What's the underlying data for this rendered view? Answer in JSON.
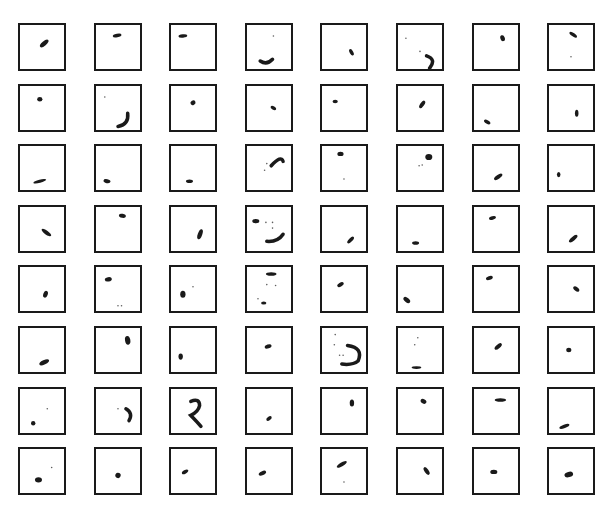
{
  "figure": {
    "rows": 8,
    "cols": 8,
    "layout": {
      "x0": 18,
      "y0": 23,
      "dx": 75.6,
      "dy": 60.6,
      "box": 46
    },
    "colors": {
      "ink": "#1a1a1a",
      "border": "#1a1a1a",
      "background": "#ffffff"
    },
    "cells": [
      [
        {
          "shapes": [
            {
              "t": "blob",
              "x": 0.55,
              "y": 0.42,
              "rx": 0.12,
              "ry": 0.05,
              "rot": -40
            }
          ]
        },
        {
          "shapes": [
            {
              "t": "blob",
              "x": 0.48,
              "y": 0.24,
              "rx": 0.1,
              "ry": 0.04,
              "rot": -10
            }
          ]
        },
        {
          "shapes": [
            {
              "t": "blob",
              "x": 0.27,
              "y": 0.25,
              "rx": 0.1,
              "ry": 0.04,
              "rot": -5
            }
          ]
        },
        {
          "shapes": [
            {
              "t": "arc",
              "d": "M0.3,0.82 Q0.45,0.92 0.58,0.78"
            },
            {
              "t": "dot",
              "x": 0.6,
              "y": 0.25
            }
          ]
        },
        {
          "shapes": [
            {
              "t": "blob",
              "x": 0.67,
              "y": 0.62,
              "rx": 0.08,
              "ry": 0.04,
              "rot": 60
            }
          ]
        },
        {
          "shapes": [
            {
              "t": "dot",
              "x": 0.18,
              "y": 0.3
            },
            {
              "t": "dot",
              "x": 0.5,
              "y": 0.6
            },
            {
              "t": "arc",
              "d": "M0.65,0.7 Q0.88,0.78 0.72,0.98"
            }
          ]
        },
        {
          "shapes": [
            {
              "t": "blob",
              "x": 0.65,
              "y": 0.3,
              "rx": 0.07,
              "ry": 0.05,
              "rot": 70
            }
          ]
        },
        {
          "shapes": [
            {
              "t": "blob",
              "x": 0.55,
              "y": 0.22,
              "rx": 0.1,
              "ry": 0.04,
              "rot": 35
            },
            {
              "t": "dot",
              "x": 0.5,
              "y": 0.72
            }
          ]
        }
      ],
      [
        {
          "shapes": [
            {
              "t": "blob",
              "x": 0.45,
              "y": 0.3,
              "rx": 0.06,
              "ry": 0.05,
              "rot": 0
            }
          ]
        },
        {
          "shapes": [
            {
              "t": "dot",
              "x": 0.2,
              "y": 0.25
            },
            {
              "t": "arc",
              "d": "M0.72,0.62 Q0.75,0.88 0.5,0.92"
            }
          ]
        },
        {
          "shapes": [
            {
              "t": "blob",
              "x": 0.5,
              "y": 0.38,
              "rx": 0.06,
              "ry": 0.05,
              "rot": -30
            }
          ]
        },
        {
          "shapes": [
            {
              "t": "blob",
              "x": 0.6,
              "y": 0.5,
              "rx": 0.07,
              "ry": 0.04,
              "rot": 30
            }
          ]
        },
        {
          "shapes": [
            {
              "t": "blob",
              "x": 0.3,
              "y": 0.35,
              "rx": 0.06,
              "ry": 0.04,
              "rot": 0
            }
          ]
        },
        {
          "shapes": [
            {
              "t": "blob",
              "x": 0.55,
              "y": 0.42,
              "rx": 0.1,
              "ry": 0.045,
              "rot": -55
            }
          ]
        },
        {
          "shapes": [
            {
              "t": "blob",
              "x": 0.3,
              "y": 0.82,
              "rx": 0.08,
              "ry": 0.04,
              "rot": 30
            }
          ]
        },
        {
          "shapes": [
            {
              "t": "blob",
              "x": 0.63,
              "y": 0.62,
              "rx": 0.04,
              "ry": 0.08,
              "rot": 0
            }
          ]
        }
      ],
      [
        {
          "shapes": [
            {
              "t": "blob",
              "x": 0.45,
              "y": 0.8,
              "rx": 0.15,
              "ry": 0.035,
              "rot": -15
            }
          ]
        },
        {
          "shapes": [
            {
              "t": "blob",
              "x": 0.25,
              "y": 0.8,
              "rx": 0.08,
              "ry": 0.045,
              "rot": 10
            }
          ]
        },
        {
          "shapes": [
            {
              "t": "blob",
              "x": 0.42,
              "y": 0.8,
              "rx": 0.08,
              "ry": 0.04,
              "rot": 0
            }
          ]
        },
        {
          "shapes": [
            {
              "t": "arc",
              "d": "M0.55,0.45 Q0.78,0.2 0.82,0.35"
            },
            {
              "t": "dot",
              "x": 0.45,
              "y": 0.4
            },
            {
              "t": "dot",
              "x": 0.4,
              "y": 0.55
            }
          ]
        },
        {
          "shapes": [
            {
              "t": "blob",
              "x": 0.42,
              "y": 0.18,
              "rx": 0.07,
              "ry": 0.05,
              "rot": 0
            },
            {
              "t": "dot",
              "x": 0.5,
              "y": 0.75
            }
          ]
        },
        {
          "shapes": [
            {
              "t": "blob",
              "x": 0.7,
              "y": 0.25,
              "rx": 0.08,
              "ry": 0.07,
              "rot": 0
            },
            {
              "t": "dot",
              "x": 0.48,
              "y": 0.45
            },
            {
              "t": "dot",
              "x": 0.55,
              "y": 0.43
            }
          ]
        },
        {
          "shapes": [
            {
              "t": "blob",
              "x": 0.55,
              "y": 0.7,
              "rx": 0.11,
              "ry": 0.045,
              "rot": -35
            }
          ]
        },
        {
          "shapes": [
            {
              "t": "blob",
              "x": 0.22,
              "y": 0.65,
              "rx": 0.04,
              "ry": 0.06,
              "rot": 0
            }
          ]
        }
      ],
      [
        {
          "shapes": [
            {
              "t": "blob",
              "x": 0.6,
              "y": 0.58,
              "rx": 0.13,
              "ry": 0.045,
              "rot": 35
            }
          ]
        },
        {
          "shapes": [
            {
              "t": "blob",
              "x": 0.6,
              "y": 0.2,
              "rx": 0.08,
              "ry": 0.045,
              "rot": 10
            }
          ]
        },
        {
          "shapes": [
            {
              "t": "blob",
              "x": 0.66,
              "y": 0.62,
              "rx": 0.05,
              "ry": 0.12,
              "rot": 20
            }
          ]
        },
        {
          "shapes": [
            {
              "t": "blob",
              "x": 0.2,
              "y": 0.32,
              "rx": 0.08,
              "ry": 0.05,
              "rot": 0
            },
            {
              "t": "dot",
              "x": 0.43,
              "y": 0.35
            },
            {
              "t": "dot",
              "x": 0.58,
              "y": 0.35
            },
            {
              "t": "dot",
              "x": 0.58,
              "y": 0.48
            },
            {
              "t": "arc",
              "d": "M0.45,0.78 Q0.7,0.8 0.82,0.62"
            }
          ]
        },
        {
          "shapes": [
            {
              "t": "blob",
              "x": 0.65,
              "y": 0.75,
              "rx": 0.1,
              "ry": 0.04,
              "rot": -45
            }
          ]
        },
        {
          "shapes": [
            {
              "t": "blob",
              "x": 0.4,
              "y": 0.82,
              "rx": 0.08,
              "ry": 0.04,
              "rot": 0
            }
          ]
        },
        {
          "shapes": [
            {
              "t": "blob",
              "x": 0.42,
              "y": 0.25,
              "rx": 0.08,
              "ry": 0.04,
              "rot": -15
            }
          ]
        },
        {
          "shapes": [
            {
              "t": "blob",
              "x": 0.55,
              "y": 0.72,
              "rx": 0.12,
              "ry": 0.045,
              "rot": -40
            }
          ]
        }
      ],
      [
        {
          "shapes": [
            {
              "t": "blob",
              "x": 0.58,
              "y": 0.62,
              "rx": 0.05,
              "ry": 0.08,
              "rot": 20
            }
          ]
        },
        {
          "shapes": [
            {
              "t": "blob",
              "x": 0.28,
              "y": 0.28,
              "rx": 0.08,
              "ry": 0.05,
              "rot": -10
            },
            {
              "t": "dot",
              "x": 0.5,
              "y": 0.88
            },
            {
              "t": "dot",
              "x": 0.58,
              "y": 0.88
            }
          ]
        },
        {
          "shapes": [
            {
              "t": "blob",
              "x": 0.27,
              "y": 0.62,
              "rx": 0.06,
              "ry": 0.08,
              "rot": 0
            },
            {
              "t": "dot",
              "x": 0.5,
              "y": 0.45
            }
          ]
        },
        {
          "shapes": [
            {
              "t": "blob",
              "x": 0.55,
              "y": 0.16,
              "rx": 0.12,
              "ry": 0.04,
              "rot": 0
            },
            {
              "t": "dot",
              "x": 0.45,
              "y": 0.4
            },
            {
              "t": "dot",
              "x": 0.65,
              "y": 0.42
            },
            {
              "t": "dot",
              "x": 0.25,
              "y": 0.72
            },
            {
              "t": "blob",
              "x": 0.38,
              "y": 0.82,
              "rx": 0.06,
              "ry": 0.035,
              "rot": 0
            }
          ]
        },
        {
          "shapes": [
            {
              "t": "blob",
              "x": 0.42,
              "y": 0.4,
              "rx": 0.08,
              "ry": 0.045,
              "rot": -30
            }
          ]
        },
        {
          "shapes": [
            {
              "t": "blob",
              "x": 0.2,
              "y": 0.75,
              "rx": 0.09,
              "ry": 0.05,
              "rot": 40
            }
          ]
        },
        {
          "shapes": [
            {
              "t": "blob",
              "x": 0.35,
              "y": 0.25,
              "rx": 0.08,
              "ry": 0.045,
              "rot": -20
            }
          ]
        },
        {
          "shapes": [
            {
              "t": "blob",
              "x": 0.62,
              "y": 0.5,
              "rx": 0.08,
              "ry": 0.045,
              "rot": 40
            }
          ]
        }
      ],
      [
        {
          "shapes": [
            {
              "t": "blob",
              "x": 0.55,
              "y": 0.78,
              "rx": 0.12,
              "ry": 0.05,
              "rot": -25
            }
          ]
        },
        {
          "shapes": [
            {
              "t": "blob",
              "x": 0.72,
              "y": 0.28,
              "rx": 0.06,
              "ry": 0.1,
              "rot": -10
            }
          ]
        },
        {
          "shapes": [
            {
              "t": "blob",
              "x": 0.22,
              "y": 0.65,
              "rx": 0.05,
              "ry": 0.07,
              "rot": 0
            }
          ]
        },
        {
          "shapes": [
            {
              "t": "blob",
              "x": 0.48,
              "y": 0.42,
              "rx": 0.08,
              "ry": 0.045,
              "rot": -20
            }
          ]
        },
        {
          "shapes": [
            {
              "t": "dot",
              "x": 0.3,
              "y": 0.15
            },
            {
              "t": "dot",
              "x": 0.28,
              "y": 0.38
            },
            {
              "t": "dot",
              "x": 0.4,
              "y": 0.62
            },
            {
              "t": "dot",
              "x": 0.48,
              "y": 0.62
            },
            {
              "t": "arc",
              "d": "M0.58,0.4 Q0.95,0.45 0.82,0.75 Q0.7,0.85 0.45,0.82"
            }
          ]
        },
        {
          "shapes": [
            {
              "t": "blob",
              "x": 0.42,
              "y": 0.9,
              "rx": 0.11,
              "ry": 0.03,
              "rot": 0
            },
            {
              "t": "dot",
              "x": 0.45,
              "y": 0.22
            },
            {
              "t": "dot",
              "x": 0.38,
              "y": 0.38
            }
          ]
        },
        {
          "shapes": [
            {
              "t": "blob",
              "x": 0.55,
              "y": 0.42,
              "rx": 0.1,
              "ry": 0.045,
              "rot": -40
            }
          ]
        },
        {
          "shapes": [
            {
              "t": "blob",
              "x": 0.45,
              "y": 0.5,
              "rx": 0.06,
              "ry": 0.05,
              "rot": 0
            }
          ]
        }
      ],
      [
        {
          "shapes": [
            {
              "t": "blob",
              "x": 0.3,
              "y": 0.78,
              "rx": 0.05,
              "ry": 0.05,
              "rot": 0
            },
            {
              "t": "dot",
              "x": 0.62,
              "y": 0.45
            }
          ]
        },
        {
          "shapes": [
            {
              "t": "dot",
              "x": 0.5,
              "y": 0.45
            },
            {
              "t": "arc",
              "d": "M0.68,0.45 Q0.85,0.55 0.75,0.72"
            }
          ]
        },
        {
          "shapes": [
            {
              "t": "arc",
              "d": "M0.45,0.28 Q0.65,0.2 0.65,0.38 Q0.62,0.52 0.45,0.6 Q0.6,0.75 0.68,0.85"
            }
          ]
        },
        {
          "shapes": [
            {
              "t": "blob",
              "x": 0.5,
              "y": 0.67,
              "rx": 0.07,
              "ry": 0.04,
              "rot": -35
            }
          ]
        },
        {
          "shapes": [
            {
              "t": "blob",
              "x": 0.68,
              "y": 0.32,
              "rx": 0.05,
              "ry": 0.08,
              "rot": 0
            }
          ]
        },
        {
          "shapes": [
            {
              "t": "blob",
              "x": 0.58,
              "y": 0.28,
              "rx": 0.07,
              "ry": 0.05,
              "rot": 30
            }
          ]
        },
        {
          "shapes": [
            {
              "t": "blob",
              "x": 0.6,
              "y": 0.25,
              "rx": 0.13,
              "ry": 0.04,
              "rot": 0
            }
          ]
        },
        {
          "shapes": [
            {
              "t": "blob",
              "x": 0.35,
              "y": 0.85,
              "rx": 0.12,
              "ry": 0.04,
              "rot": -20
            }
          ]
        }
      ],
      [
        {
          "shapes": [
            {
              "t": "blob",
              "x": 0.42,
              "y": 0.7,
              "rx": 0.08,
              "ry": 0.06,
              "rot": 0
            },
            {
              "t": "dot",
              "x": 0.72,
              "y": 0.42
            }
          ]
        },
        {
          "shapes": [
            {
              "t": "blob",
              "x": 0.5,
              "y": 0.6,
              "rx": 0.06,
              "ry": 0.06,
              "rot": 30
            }
          ]
        },
        {
          "shapes": [
            {
              "t": "blob",
              "x": 0.32,
              "y": 0.52,
              "rx": 0.08,
              "ry": 0.04,
              "rot": -30
            }
          ]
        },
        {
          "shapes": [
            {
              "t": "blob",
              "x": 0.35,
              "y": 0.55,
              "rx": 0.09,
              "ry": 0.045,
              "rot": -25
            }
          ]
        },
        {
          "shapes": [
            {
              "t": "blob",
              "x": 0.45,
              "y": 0.35,
              "rx": 0.13,
              "ry": 0.045,
              "rot": -30
            },
            {
              "t": "dot",
              "x": 0.5,
              "y": 0.75
            }
          ]
        },
        {
          "shapes": [
            {
              "t": "blob",
              "x": 0.65,
              "y": 0.5,
              "rx": 0.1,
              "ry": 0.045,
              "rot": 55
            }
          ]
        },
        {
          "shapes": [
            {
              "t": "blob",
              "x": 0.45,
              "y": 0.52,
              "rx": 0.08,
              "ry": 0.05,
              "rot": 0
            }
          ]
        },
        {
          "shapes": [
            {
              "t": "blob",
              "x": 0.45,
              "y": 0.58,
              "rx": 0.1,
              "ry": 0.06,
              "rot": -15
            }
          ]
        }
      ]
    ]
  }
}
